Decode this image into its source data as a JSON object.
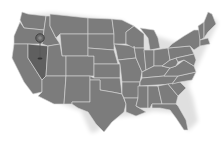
{
  "map": {
    "region": "United States (contiguous)",
    "highlighted_state": "Nevada",
    "colors": {
      "background": "#ffffff",
      "state_fill": "#7c7c7c",
      "state_border": "#d8d8d8",
      "highlight_fill": "#5f5f5f",
      "pin": "#555555"
    },
    "marker": {
      "icon": "map-pin-icon",
      "state": "Nevada"
    }
  }
}
